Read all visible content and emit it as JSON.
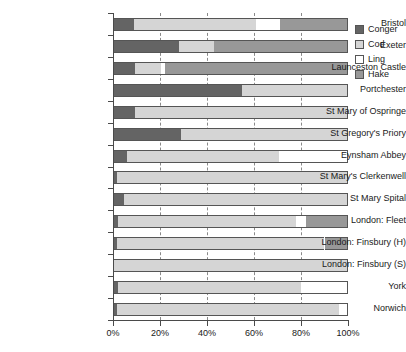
{
  "chart_data": {
    "type": "bar",
    "orientation": "horizontal",
    "stacked": true,
    "stack_mode": "percent",
    "title": "",
    "xlabel": "",
    "ylabel": "",
    "xlim": [
      0,
      100
    ],
    "grid": true,
    "grid_axis": "x",
    "grid_style": "dashed",
    "legend_position": "top-right",
    "xticks": [
      0,
      20,
      40,
      60,
      80,
      100
    ],
    "xtick_labels": [
      "0%",
      "20%",
      "40%",
      "60%",
      "80%",
      "100%"
    ],
    "categories": [
      "Bristol",
      "Exeter",
      "Launceston Castle",
      "Portchester",
      "St Mary of Ospringe",
      "St Gregory's Priory",
      "Eynsham Abbey",
      "St Mary's Clerkenwell",
      "St Mary Spital",
      "London: Fleet",
      "London: Finsbury (H)",
      "London: Finsbury (S)",
      "York",
      "Norwich"
    ],
    "series": [
      {
        "name": "Conger",
        "color": "#646464",
        "values": [
          9,
          28,
          9.5,
          55,
          9.5,
          29,
          6,
          1.5,
          4.5,
          2,
          1.5,
          0,
          2,
          1.5
        ]
      },
      {
        "name": "Cod",
        "color": "#d5d5d5",
        "values": [
          52,
          15,
          11,
          45,
          90.5,
          71,
          64.5,
          98.5,
          95.5,
          76,
          88.5,
          100,
          78,
          94.5
        ]
      },
      {
        "name": "Ling",
        "color": "#ffffff",
        "values": [
          10,
          0,
          1.5,
          0,
          0,
          0,
          29.5,
          0,
          0,
          4,
          0,
          0,
          20,
          4
        ]
      },
      {
        "name": "Hake",
        "color": "#989898",
        "values": [
          29,
          57,
          78,
          0,
          0,
          0,
          0,
          0,
          0,
          18,
          10,
          0,
          0,
          0
        ]
      }
    ]
  },
  "legend": {
    "items": [
      {
        "label": "Conger",
        "color": "#646464"
      },
      {
        "label": "Cod",
        "color": "#d5d5d5"
      },
      {
        "label": "Ling",
        "color": "#ffffff"
      },
      {
        "label": "Hake",
        "color": "#989898"
      }
    ]
  },
  "colors": {
    "axis": "#4a4a4a",
    "grid": "#8a8a8a",
    "text": "#1a1a1a",
    "background": "#ffffff"
  }
}
